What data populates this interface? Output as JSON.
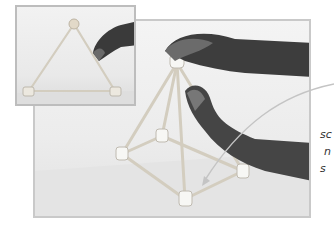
{
  "figure": {
    "main_photo": {
      "alt": "Two hands assembling a square pyramid from sticks and connector nodes",
      "subject": "pyramid-model"
    },
    "inset_photo": {
      "alt": "Hand placing a ball on top of a triangle made of sticks",
      "subject": "triangle-model"
    },
    "callout": {
      "lines": [
        "sc",
        "n",
        "s"
      ]
    }
  },
  "colors": {
    "frame": "#c9c9c9",
    "stick": "#d8d3c6",
    "hand": "#3a3a3a",
    "callout_line": "#bdbdbd"
  }
}
